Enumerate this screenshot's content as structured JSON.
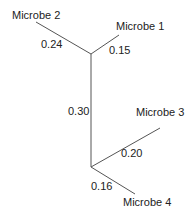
{
  "tree": {
    "type": "unrooted-phylogenetic-tree",
    "line_color": "#555555",
    "taxa": [
      {
        "name": "Microbe 1",
        "branch_length": "0.15"
      },
      {
        "name": "Microbe 2",
        "branch_length": "0.24"
      },
      {
        "name": "Microbe 3",
        "branch_length": "0.20"
      },
      {
        "name": "Microbe 4",
        "branch_length": "0.16"
      }
    ],
    "internal_branch": {
      "length": "0.30"
    }
  }
}
